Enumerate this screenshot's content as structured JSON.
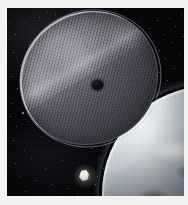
{
  "image": {
    "title": "Large mesh reflector disc in orbit above Earth",
    "kind": "space-illustration",
    "width": 188,
    "height": 205,
    "border": {
      "style": "light photographic matte",
      "color": "#f2f2f2",
      "left_px": 7,
      "top_px": 8,
      "right_px": 4,
      "bottom_px": 9
    },
    "background": {
      "label": "Starfield",
      "color": "#050508"
    }
  },
  "objects": [
    {
      "id": "reflector-disc",
      "label": "Large elliptical mesh reflector",
      "description": "Tilted circular woven-mesh antenna or solar sail seen at an oblique angle, bright rim highlight along upper-left limb, diagonal glare band across the middle",
      "color_light": "#9a9aa4",
      "color_dark": "#33333b",
      "rim_color": "#ebeef8",
      "rotation_deg": -31,
      "center": {
        "x": 82,
        "y": 70
      },
      "size": {
        "width": 140,
        "height": 132
      }
    },
    {
      "id": "hub-spot",
      "label": "Dark central hub",
      "description": "Small black circular feed or occulter near disc centre",
      "color": "#08080b",
      "center": {
        "x": 90,
        "y": 77
      },
      "size": {
        "width": 11,
        "height": 10
      }
    },
    {
      "id": "earth-limb",
      "label": "Earth limb",
      "description": "Cloud-covered curve of Earth entering from the lower-right corner with bright atmospheric edge",
      "color_light": "#f4f6f8",
      "color_dark": "#2d3238",
      "center": {
        "x": 202,
        "y": 185
      },
      "size": {
        "width": 215,
        "height": 215
      }
    },
    {
      "id": "spacecraft",
      "label": "Bright spacecraft",
      "description": "Small brilliantly lit satellite silhouetted against black space below the disc",
      "color": "#ffffff",
      "center": {
        "x": 77,
        "y": 167
      },
      "size": {
        "width": 10,
        "height": 11
      }
    }
  ],
  "stars": {
    "label": "Background stars",
    "color": "#ffffff",
    "count": 78,
    "points": [
      {
        "x": 18,
        "y": 14,
        "r": 0.6,
        "o": 0.55
      },
      {
        "x": 32,
        "y": 9,
        "r": 0.5,
        "o": 0.45
      },
      {
        "x": 48,
        "y": 6,
        "r": 0.6,
        "o": 0.5
      },
      {
        "x": 8,
        "y": 26,
        "r": 0.7,
        "o": 0.6
      },
      {
        "x": 23,
        "y": 33,
        "r": 0.5,
        "o": 0.4
      },
      {
        "x": 6,
        "y": 44,
        "r": 0.6,
        "o": 0.5
      },
      {
        "x": 13,
        "y": 57,
        "r": 0.5,
        "o": 0.42
      },
      {
        "x": 4,
        "y": 68,
        "r": 0.6,
        "o": 0.5
      },
      {
        "x": 10,
        "y": 80,
        "r": 0.7,
        "o": 0.6
      },
      {
        "x": 5,
        "y": 95,
        "r": 0.5,
        "o": 0.45
      },
      {
        "x": 15,
        "y": 104,
        "r": 0.8,
        "o": 0.7
      },
      {
        "x": 9,
        "y": 118,
        "r": 0.6,
        "o": 0.5
      },
      {
        "x": 21,
        "y": 113,
        "r": 0.5,
        "o": 0.4
      },
      {
        "x": 6,
        "y": 132,
        "r": 0.6,
        "o": 0.5
      },
      {
        "x": 17,
        "y": 142,
        "r": 0.5,
        "o": 0.42
      },
      {
        "x": 8,
        "y": 155,
        "r": 0.7,
        "o": 0.55
      },
      {
        "x": 24,
        "y": 150,
        "r": 0.5,
        "o": 0.4
      },
      {
        "x": 12,
        "y": 168,
        "r": 0.6,
        "o": 0.5
      },
      {
        "x": 28,
        "y": 172,
        "r": 0.5,
        "o": 0.42
      },
      {
        "x": 18,
        "y": 183,
        "r": 0.6,
        "o": 0.5
      },
      {
        "x": 38,
        "y": 160,
        "r": 0.5,
        "o": 0.4
      },
      {
        "x": 44,
        "y": 176,
        "r": 0.6,
        "o": 0.5
      },
      {
        "x": 55,
        "y": 152,
        "r": 0.5,
        "o": 0.42
      },
      {
        "x": 60,
        "y": 180,
        "r": 0.6,
        "o": 0.5
      },
      {
        "x": 52,
        "y": 188,
        "r": 0.5,
        "o": 0.4
      },
      {
        "x": 70,
        "y": 186,
        "r": 0.5,
        "o": 0.42
      },
      {
        "x": 88,
        "y": 176,
        "r": 0.6,
        "o": 0.5
      },
      {
        "x": 96,
        "y": 160,
        "r": 0.5,
        "o": 0.45
      },
      {
        "x": 100,
        "y": 184,
        "r": 0.6,
        "o": 0.5
      },
      {
        "x": 110,
        "y": 170,
        "r": 0.5,
        "o": 0.4
      },
      {
        "x": 104,
        "y": 146,
        "r": 0.8,
        "o": 0.75
      },
      {
        "x": 114,
        "y": 138,
        "r": 0.6,
        "o": 0.55
      },
      {
        "x": 97,
        "y": 134,
        "r": 0.7,
        "o": 0.65
      },
      {
        "x": 108,
        "y": 126,
        "r": 0.6,
        "o": 0.55
      },
      {
        "x": 118,
        "y": 120,
        "r": 0.7,
        "o": 0.65
      },
      {
        "x": 126,
        "y": 130,
        "r": 0.6,
        "o": 0.5
      },
      {
        "x": 101,
        "y": 118,
        "r": 0.5,
        "o": 0.45
      },
      {
        "x": 112,
        "y": 110,
        "r": 0.8,
        "o": 0.75
      },
      {
        "x": 122,
        "y": 104,
        "r": 0.6,
        "o": 0.55
      },
      {
        "x": 131,
        "y": 114,
        "r": 0.5,
        "o": 0.45
      },
      {
        "x": 128,
        "y": 96,
        "r": 0.7,
        "o": 0.6
      },
      {
        "x": 137,
        "y": 88,
        "r": 0.6,
        "o": 0.55
      },
      {
        "x": 144,
        "y": 98,
        "r": 0.5,
        "o": 0.45
      },
      {
        "x": 135,
        "y": 106,
        "r": 0.5,
        "o": 0.4
      },
      {
        "x": 148,
        "y": 78,
        "r": 0.7,
        "o": 0.6
      },
      {
        "x": 156,
        "y": 88,
        "r": 0.5,
        "o": 0.45
      },
      {
        "x": 141,
        "y": 72,
        "r": 0.6,
        "o": 0.5
      },
      {
        "x": 152,
        "y": 64,
        "r": 0.5,
        "o": 0.45
      },
      {
        "x": 160,
        "y": 72,
        "r": 0.6,
        "o": 0.5
      },
      {
        "x": 146,
        "y": 58,
        "r": 0.5,
        "o": 0.4
      },
      {
        "x": 158,
        "y": 50,
        "r": 0.6,
        "o": 0.5
      },
      {
        "x": 167,
        "y": 60,
        "r": 0.5,
        "o": 0.42
      },
      {
        "x": 152,
        "y": 42,
        "r": 0.6,
        "o": 0.5
      },
      {
        "x": 164,
        "y": 34,
        "r": 0.5,
        "o": 0.45
      },
      {
        "x": 172,
        "y": 46,
        "r": 0.6,
        "o": 0.5
      },
      {
        "x": 157,
        "y": 26,
        "r": 0.5,
        "o": 0.4
      },
      {
        "x": 168,
        "y": 18,
        "r": 0.6,
        "o": 0.5
      },
      {
        "x": 176,
        "y": 28,
        "r": 0.5,
        "o": 0.42
      },
      {
        "x": 162,
        "y": 10,
        "r": 0.6,
        "o": 0.5
      },
      {
        "x": 174,
        "y": 6,
        "r": 0.5,
        "o": 0.45
      },
      {
        "x": 142,
        "y": 20,
        "r": 0.5,
        "o": 0.4
      },
      {
        "x": 150,
        "y": 12,
        "r": 0.6,
        "o": 0.48
      },
      {
        "x": 132,
        "y": 14,
        "r": 0.5,
        "o": 0.38
      },
      {
        "x": 178,
        "y": 14,
        "r": 0.6,
        "o": 0.5
      },
      {
        "x": 180,
        "y": 40,
        "r": 0.5,
        "o": 0.42
      },
      {
        "x": 170,
        "y": 80,
        "r": 0.6,
        "o": 0.5
      },
      {
        "x": 178,
        "y": 66,
        "r": 0.5,
        "o": 0.4
      },
      {
        "x": 121,
        "y": 148,
        "r": 0.5,
        "o": 0.4
      },
      {
        "x": 92,
        "y": 150,
        "r": 0.5,
        "o": 0.42
      },
      {
        "x": 84,
        "y": 140,
        "r": 0.6,
        "o": 0.5
      },
      {
        "x": 78,
        "y": 192,
        "r": 0.5,
        "o": 0.38
      },
      {
        "x": 34,
        "y": 128,
        "r": 0.5,
        "o": 0.4
      },
      {
        "x": 26,
        "y": 92,
        "r": 0.5,
        "o": 0.38
      },
      {
        "x": 3,
        "y": 108,
        "r": 0.5,
        "o": 0.4
      },
      {
        "x": 2,
        "y": 14,
        "r": 0.5,
        "o": 0.35
      },
      {
        "x": 40,
        "y": 4,
        "r": 0.5,
        "o": 0.4
      },
      {
        "x": 64,
        "y": 2,
        "r": 0.5,
        "o": 0.35
      },
      {
        "x": 90,
        "y": 168,
        "r": 0.5,
        "o": 0.4
      }
    ]
  }
}
